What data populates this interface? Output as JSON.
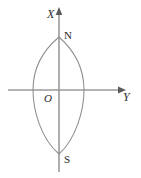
{
  "figure": {
    "background_color": "#ffffff",
    "width": 141,
    "height": 178,
    "axis_color": "#9a9a9a",
    "curve_color": "#8d8d8d",
    "label_color": "#2b2b2b"
  },
  "axes": {
    "vertical": {
      "name": "X",
      "label": "X",
      "label_style": "italic",
      "orientation": "vertical",
      "arrow_direction": "up",
      "x": 59,
      "y_top": 8,
      "y_bottom": 172
    },
    "horizontal": {
      "name": "Y",
      "label": "Y",
      "label_style": "italic",
      "orientation": "horizontal",
      "arrow_direction": "right",
      "y": 90,
      "x_left": 8,
      "x_right": 125
    },
    "origin": {
      "label": "O",
      "label_style": "italic",
      "x": 59,
      "y": 90
    }
  },
  "curve": {
    "type": "lens",
    "description": "vesica / meridian ellipse formed by two symmetric circular arcs",
    "vertices": [
      {
        "label": "N",
        "label_style": "upright",
        "position": "top",
        "x": 59,
        "y": 37
      },
      {
        "label": "S",
        "label_style": "upright",
        "position": "bottom",
        "x": 59,
        "y": 154
      }
    ],
    "extremes": [
      {
        "side": "left",
        "x": 33,
        "y": 90
      },
      {
        "side": "right",
        "x": 84,
        "y": 90
      }
    ]
  },
  "labels": {
    "x_axis": "X",
    "y_axis": "Y",
    "origin": "O",
    "north_pole": "N",
    "south_pole": "S"
  }
}
